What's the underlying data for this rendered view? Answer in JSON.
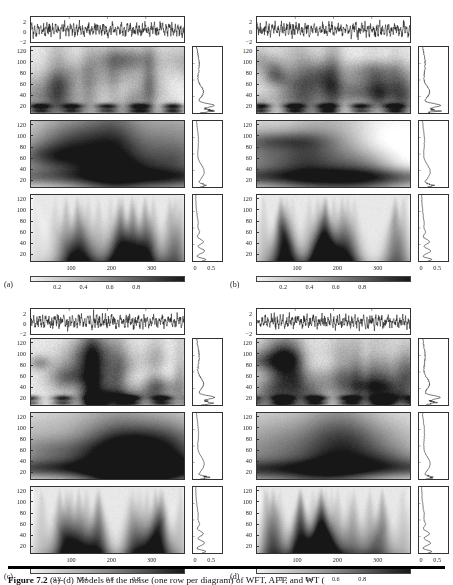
{
  "figure": {
    "caption_label": "Figure 7.2",
    "caption_text": "(a)-(d) Models of the noise (one row per diagram) of WFT, AFT, and WT ("
  },
  "panels": [
    {
      "letter": "(a)",
      "signal": {
        "yticks": [
          "2",
          "0",
          "−2"
        ]
      },
      "heatmaps": [
        {
          "name": "wft",
          "yticks": [
            "120",
            "100",
            "80",
            "60",
            "40",
            "20"
          ]
        },
        {
          "name": "aft",
          "yticks": [
            "120",
            "100",
            "80",
            "60",
            "40",
            "20"
          ]
        },
        {
          "name": "wt",
          "yticks": [
            "120",
            "100",
            "80",
            "60",
            "40",
            "20"
          ]
        }
      ],
      "xticks": [
        "100",
        "200",
        "300"
      ],
      "marginal_xticks": [
        "0",
        "0.5"
      ],
      "colorbar": {
        "ticks": [
          "0.2",
          "0.4",
          "0.6",
          "0.8"
        ]
      }
    },
    {
      "letter": "(b)",
      "signal": {
        "yticks": [
          "2",
          "0",
          "−2"
        ]
      },
      "heatmaps": [
        {
          "name": "wft",
          "yticks": [
            "120",
            "100",
            "80",
            "60",
            "40",
            "20"
          ]
        },
        {
          "name": "aft",
          "yticks": [
            "120",
            "100",
            "80",
            "60",
            "40",
            "20"
          ]
        },
        {
          "name": "wt",
          "yticks": [
            "120",
            "100",
            "80",
            "60",
            "40",
            "20"
          ]
        }
      ],
      "xticks": [
        "100",
        "200",
        "300"
      ],
      "marginal_xticks": [
        "0",
        "0.5"
      ],
      "colorbar": {
        "ticks": [
          "0.2",
          "0.4",
          "0.6",
          "0.8"
        ]
      }
    },
    {
      "letter": "(c)",
      "signal": {
        "yticks": [
          "2",
          "0",
          "−2"
        ]
      },
      "heatmaps": [
        {
          "name": "wft",
          "yticks": [
            "120",
            "100",
            "80",
            "60",
            "40",
            "20"
          ]
        },
        {
          "name": "aft",
          "yticks": [
            "120",
            "100",
            "80",
            "60",
            "40",
            "20"
          ]
        },
        {
          "name": "wt",
          "yticks": [
            "120",
            "100",
            "80",
            "60",
            "40",
            "20"
          ]
        }
      ],
      "xticks": [
        "100",
        "200",
        "300"
      ],
      "marginal_xticks": [
        "0",
        "0.5"
      ],
      "colorbar": {
        "ticks": [
          "0.2",
          "0.4",
          "0.6",
          "0.8"
        ]
      }
    },
    {
      "letter": "(d)",
      "signal": {
        "yticks": [
          "2",
          "0",
          "−2"
        ]
      },
      "heatmaps": [
        {
          "name": "wft",
          "yticks": [
            "120",
            "100",
            "80",
            "60",
            "40",
            "20"
          ]
        },
        {
          "name": "aft",
          "yticks": [
            "120",
            "100",
            "80",
            "60",
            "40",
            "20"
          ]
        },
        {
          "name": "wt",
          "yticks": [
            "120",
            "100",
            "80",
            "60",
            "40",
            "20"
          ]
        }
      ],
      "xticks": [
        "100",
        "200",
        "300"
      ],
      "marginal_xticks": [
        "0",
        "0.5"
      ],
      "colorbar": {
        "ticks": [
          "0.2",
          "0.4",
          "0.6",
          "0.8"
        ]
      }
    }
  ],
  "chart_data": {
    "type": "heatmap",
    "title": "",
    "xlabel": "",
    "ylabel": "",
    "colormap": "grayscale-light-to-dark",
    "xlim": [
      0,
      380
    ],
    "ylim": [
      5,
      128
    ],
    "xticks": [
      100,
      200,
      300
    ],
    "yticks": [
      20,
      40,
      60,
      80,
      100,
      120
    ],
    "signal_ylim": [
      -3,
      3
    ],
    "signal_yticks": [
      -2,
      0,
      2
    ],
    "marginal_xlim": [
      0,
      0.75
    ],
    "marginal_xticks": [
      0,
      0.5
    ],
    "colorbar_range": [
      0.1,
      0.9
    ],
    "colorbar_ticks": [
      0.2,
      0.4,
      0.6,
      0.8
    ],
    "grid": false,
    "legend": "none",
    "subplots": [
      {
        "panel": "(a)",
        "rows": [
          "WFT",
          "AFT",
          "WT"
        ]
      },
      {
        "panel": "(b)",
        "rows": [
          "WFT",
          "AFT",
          "WT"
        ]
      },
      {
        "panel": "(c)",
        "rows": [
          "WFT",
          "AFT",
          "WT"
        ]
      },
      {
        "panel": "(d)",
        "rows": [
          "WFT",
          "AFT",
          "WT"
        ]
      }
    ],
    "marginal_series": [
      {
        "name": "WFT marginal",
        "peak_frequency": 18,
        "peak_value": 0.62,
        "shape": "sharp low-frequency peak with broad shoulder near 45"
      },
      {
        "name": "AFT marginal",
        "peak_frequency": 30,
        "peak_value": 0.28,
        "shape": "smooth broad hump"
      },
      {
        "name": "WT marginal",
        "peak_frequency": 22,
        "peak_value": 0.3,
        "shape": "oscillatory ripples decaying with frequency"
      }
    ]
  }
}
